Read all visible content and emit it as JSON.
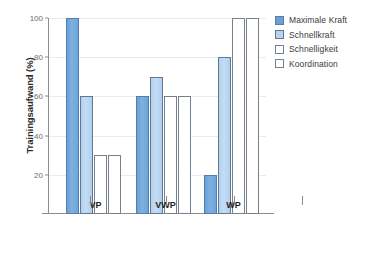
{
  "chart_data": {
    "type": "bar",
    "title": "",
    "xlabel": "",
    "ylabel": "Trainingsaufwand (%)",
    "ylim": [
      0,
      100
    ],
    "yticks": [
      20,
      40,
      60,
      80,
      100
    ],
    "grid": true,
    "legend_position": "right",
    "categories": [
      "VP",
      "VWP",
      "WP"
    ],
    "series": [
      {
        "name": "Maximale Kraft",
        "color": "#6F9FD2",
        "values": [
          100,
          60,
          20
        ]
      },
      {
        "name": "Schnellkraft",
        "color": "#B6D4F0",
        "values": [
          60,
          70,
          80
        ]
      },
      {
        "name": "Schnelligkeit",
        "color": "#FFFFFF",
        "values": [
          30,
          60,
          100
        ]
      },
      {
        "name": "Koordination",
        "color": "#FFFFFF",
        "values": [
          30,
          60,
          100
        ]
      }
    ]
  },
  "axes": {
    "y_title": "Trainingsaufwand (%)",
    "y_tick_labels": [
      "100",
      "80",
      "60",
      "40",
      "20"
    ],
    "x_tick_labels": [
      "VP",
      "VWP",
      "WP"
    ]
  },
  "legend": {
    "items": [
      {
        "label": "Maximale Kraft"
      },
      {
        "label": "Schnellkraft"
      },
      {
        "label": "Schnelligkeit"
      },
      {
        "label": "Koordination"
      }
    ]
  }
}
